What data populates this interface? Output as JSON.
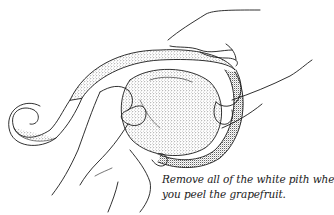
{
  "illustration": {
    "subject": "hands peeling a grapefruit, spiral of peel hanging to the left",
    "line_color": "#1a1a1a",
    "background": "#ffffff"
  },
  "caption": {
    "line1": "Remove all of the white pith when",
    "line2": "you peel the grapefruit."
  }
}
